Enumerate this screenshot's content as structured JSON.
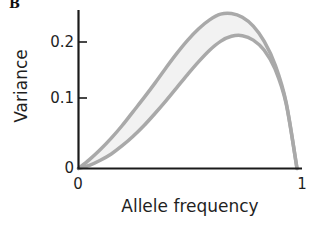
{
  "figure": {
    "panel_label": "B",
    "background_color": "#ffffff"
  },
  "axes": {
    "xlabel": "Allele frequency",
    "ylabel": "Variance",
    "x_tick_labels": [
      "0",
      "1"
    ],
    "y_tick_labels": [
      "0",
      "0.1",
      "0.2"
    ],
    "axis_color": "#1a1a1a"
  },
  "chart_data": {
    "type": "area",
    "title": "",
    "subtitle": "",
    "panel_label": "B",
    "xlabel": "Allele frequency",
    "ylabel": "Variance",
    "xlim": [
      0,
      1
    ],
    "ylim": [
      0,
      0.26
    ],
    "xticks": [
      0,
      1
    ],
    "xtick_labels": [
      "0",
      "1"
    ],
    "yticks": [
      0,
      0.1,
      0.2
    ],
    "ytick_labels": [
      "0",
      "0.1",
      "0.2"
    ],
    "grid": false,
    "legend": null,
    "legend_position": "none",
    "annotations": [],
    "band_fill_color": "#f2f2f2",
    "curve_color": "#a9a9a9",
    "curve_width": 3.5,
    "x": [
      0.0,
      0.05,
      0.1,
      0.15,
      0.2,
      0.25,
      0.3,
      0.35,
      0.4,
      0.45,
      0.5,
      0.55,
      0.6,
      0.65,
      0.7,
      0.75,
      0.8,
      0.85,
      0.9,
      0.95,
      1.0
    ],
    "series": [
      {
        "name": "upper bound",
        "values": [
          0.0,
          0.014,
          0.03,
          0.048,
          0.068,
          0.09,
          0.112,
          0.135,
          0.159,
          0.182,
          0.203,
          0.221,
          0.235,
          0.244,
          0.245,
          0.239,
          0.225,
          0.201,
          0.164,
          0.105,
          0.0
        ]
      },
      {
        "name": "lower bound",
        "values": [
          0.0,
          0.005,
          0.013,
          0.023,
          0.036,
          0.051,
          0.068,
          0.087,
          0.107,
          0.128,
          0.149,
          0.169,
          0.187,
          0.201,
          0.209,
          0.21,
          0.203,
          0.187,
          0.157,
          0.103,
          0.0
        ]
      }
    ]
  }
}
